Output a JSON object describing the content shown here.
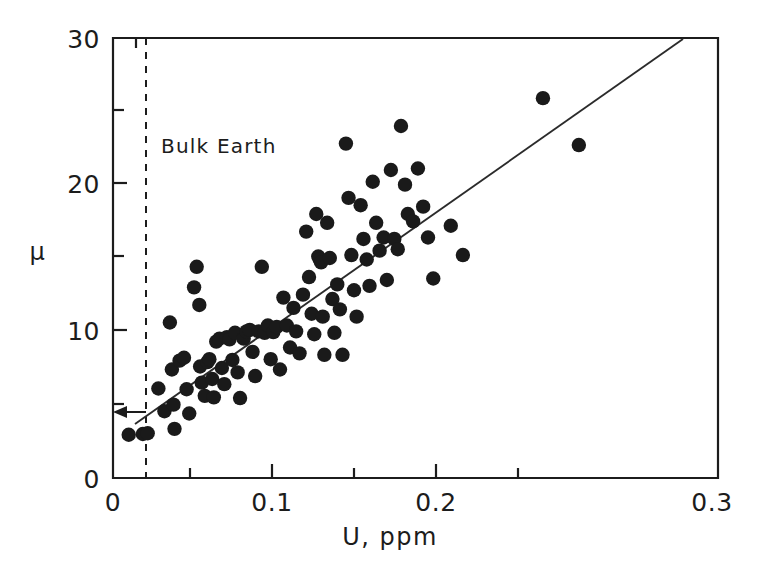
{
  "chart_data": {
    "type": "scatter",
    "title": "",
    "xlabel": "U, ppm",
    "ylabel": "μ",
    "xlim": [
      0,
      0.3
    ],
    "ylim": [
      0,
      30
    ],
    "xticks": [
      0,
      0.1,
      0.2,
      0.3
    ],
    "xtick_labels": [
      "0",
      "0.1",
      "0.2",
      "0.3"
    ],
    "yticks": [
      0,
      10,
      20,
      30
    ],
    "ytick_labels": [
      "0",
      "10",
      "20",
      "30"
    ],
    "grid": false,
    "legend": "none",
    "marker": "filled-circle",
    "marker_color": "#1a1a1a",
    "annotations": [
      {
        "name": "bulk-earth",
        "text": "Bulk Earth",
        "x": 0.0235,
        "y": 23.6,
        "kind": "text"
      },
      {
        "name": "bulk-earth-vline",
        "text": "",
        "x": 0.0192,
        "style": "dashed",
        "kind": "vline",
        "y_from": 0,
        "y_to": 30
      },
      {
        "name": "bulk-earth-arrow",
        "text": "",
        "kind": "arrow",
        "x_from": 0.0162,
        "y_from": 4.45,
        "x_to": 0.0025,
        "y_to": 4.45
      }
    ],
    "fit_line": {
      "name": "regression-line",
      "x_from": 0.0108,
      "y_from": 3.7,
      "x_to": 0.2803,
      "y_to": 30.0
    },
    "series": [
      {
        "name": "samples",
        "points": [
          [
            0.0078,
            2.95
          ],
          [
            0.0148,
            3.0
          ],
          [
            0.0172,
            3.05
          ],
          [
            0.0225,
            6.1
          ],
          [
            0.0255,
            4.55
          ],
          [
            0.0282,
            10.6
          ],
          [
            0.0292,
            7.4
          ],
          [
            0.03,
            5.0
          ],
          [
            0.0305,
            3.35
          ],
          [
            0.033,
            8.0
          ],
          [
            0.0352,
            8.2
          ],
          [
            0.0365,
            6.05
          ],
          [
            0.0378,
            4.4
          ],
          [
            0.0402,
            13.0
          ],
          [
            0.0415,
            14.4
          ],
          [
            0.0428,
            11.8
          ],
          [
            0.0432,
            7.6
          ],
          [
            0.044,
            6.5
          ],
          [
            0.0455,
            5.6
          ],
          [
            0.0468,
            7.9
          ],
          [
            0.0478,
            8.1
          ],
          [
            0.0492,
            6.75
          ],
          [
            0.05,
            5.5
          ],
          [
            0.0512,
            9.3
          ],
          [
            0.0528,
            9.5
          ],
          [
            0.054,
            7.5
          ],
          [
            0.0552,
            6.4
          ],
          [
            0.0565,
            9.6
          ],
          [
            0.0578,
            9.45
          ],
          [
            0.0592,
            8.05
          ],
          [
            0.0605,
            9.9
          ],
          [
            0.0618,
            7.2
          ],
          [
            0.063,
            5.45
          ],
          [
            0.0648,
            9.5
          ],
          [
            0.0662,
            10.0
          ],
          [
            0.0678,
            10.1
          ],
          [
            0.0692,
            8.6
          ],
          [
            0.0705,
            6.95
          ],
          [
            0.0722,
            10.0
          ],
          [
            0.0738,
            14.4
          ],
          [
            0.0752,
            9.9
          ],
          [
            0.0768,
            10.4
          ],
          [
            0.0782,
            8.1
          ],
          [
            0.0795,
            9.95
          ],
          [
            0.0812,
            10.3
          ],
          [
            0.0828,
            7.4
          ],
          [
            0.0845,
            12.3
          ],
          [
            0.0862,
            10.4
          ],
          [
            0.0878,
            8.9
          ],
          [
            0.0895,
            11.6
          ],
          [
            0.0908,
            10.0
          ],
          [
            0.0925,
            8.5
          ],
          [
            0.0942,
            12.5
          ],
          [
            0.0958,
            16.8
          ],
          [
            0.0972,
            13.7
          ],
          [
            0.0985,
            11.2
          ],
          [
            0.0998,
            9.8
          ],
          [
            0.1008,
            18.0
          ],
          [
            0.1018,
            15.1
          ],
          [
            0.1025,
            14.9
          ],
          [
            0.1032,
            14.7
          ],
          [
            0.104,
            11.0
          ],
          [
            0.1048,
            8.4
          ],
          [
            0.1062,
            17.4
          ],
          [
            0.1075,
            15.0
          ],
          [
            0.1088,
            12.2
          ],
          [
            0.1098,
            9.9
          ],
          [
            0.1112,
            13.2
          ],
          [
            0.1125,
            11.5
          ],
          [
            0.1138,
            8.4
          ],
          [
            0.1155,
            22.8
          ],
          [
            0.1168,
            19.1
          ],
          [
            0.1182,
            15.2
          ],
          [
            0.1195,
            12.8
          ],
          [
            0.1208,
            11.0
          ],
          [
            0.1228,
            18.6
          ],
          [
            0.1242,
            16.3
          ],
          [
            0.1258,
            14.9
          ],
          [
            0.1272,
            13.1
          ],
          [
            0.1288,
            20.2
          ],
          [
            0.1305,
            17.4
          ],
          [
            0.1322,
            15.5
          ],
          [
            0.1342,
            16.4
          ],
          [
            0.1358,
            13.5
          ],
          [
            0.1378,
            21.0
          ],
          [
            0.1395,
            16.3
          ],
          [
            0.1412,
            15.6
          ],
          [
            0.1428,
            24.0
          ],
          [
            0.1448,
            20.0
          ],
          [
            0.1462,
            18.0
          ],
          [
            0.1488,
            17.5
          ],
          [
            0.1512,
            21.1
          ],
          [
            0.1538,
            18.5
          ],
          [
            0.1562,
            16.4
          ],
          [
            0.1588,
            13.6
          ],
          [
            0.1675,
            17.2
          ],
          [
            0.1735,
            15.2
          ],
          [
            0.2132,
            25.9
          ],
          [
            0.231,
            22.7
          ]
        ]
      }
    ]
  },
  "axes_geometry": {
    "note": "pixel geometry of the plot frame",
    "left_px": 113,
    "right_px": 718,
    "top_px": 38,
    "bottom_px": 478
  }
}
